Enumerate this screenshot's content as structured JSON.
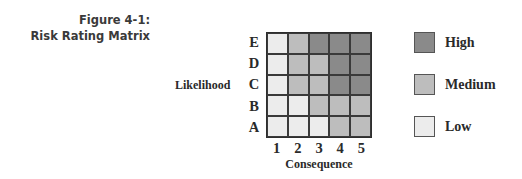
{
  "caption": {
    "line1": "Figure 4-1:",
    "line2": "Risk Rating Matrix"
  },
  "axes": {
    "y_label": "Likelihood",
    "x_label": "Consequence",
    "rows": [
      "E",
      "D",
      "C",
      "B",
      "A"
    ],
    "cols": [
      "1",
      "2",
      "3",
      "4",
      "5"
    ]
  },
  "colors": {
    "High": "#8a8a8a",
    "Medium": "#bdbdbd",
    "Low": "#ececec"
  },
  "matrix": {
    "E": [
      "Low",
      "Medium",
      "High",
      "High",
      "High"
    ],
    "D": [
      "Low",
      "Medium",
      "Medium",
      "High",
      "High"
    ],
    "C": [
      "Low",
      "Medium",
      "Medium",
      "High",
      "High"
    ],
    "B": [
      "Low",
      "Low",
      "Medium",
      "Medium",
      "Medium"
    ],
    "A": [
      "Low",
      "Low",
      "Low",
      "Medium",
      "Medium"
    ]
  },
  "legend": {
    "items": [
      {
        "label": "High",
        "color": "#8a8a8a"
      },
      {
        "label": "Medium",
        "color": "#bdbdbd"
      },
      {
        "label": "Low",
        "color": "#ececec"
      }
    ]
  }
}
